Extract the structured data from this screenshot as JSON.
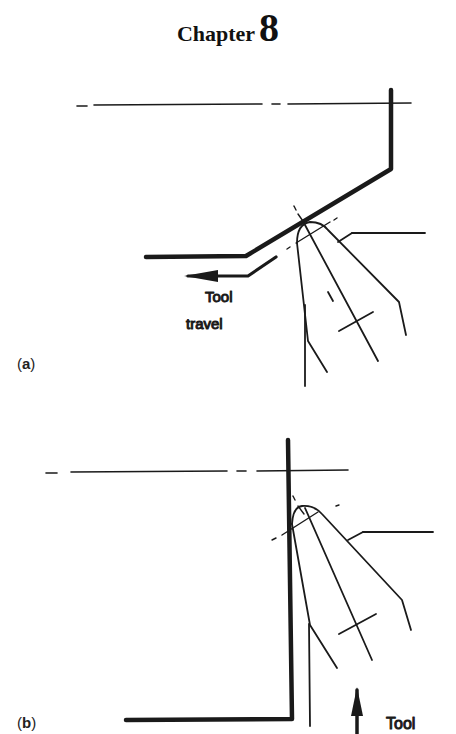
{
  "header": {
    "chapter_word": "Chapter",
    "chapter_number": "8"
  },
  "figure_a": {
    "panel_label_open": "(",
    "panel_label_letter": "a",
    "panel_label_close": ")",
    "annotation_line1": "Tool",
    "annotation_line2": "travel",
    "arrow_direction": "left"
  },
  "figure_b": {
    "panel_label_open": "(",
    "panel_label_letter": "b",
    "panel_label_close": ")",
    "annotation_line1": "Tool",
    "arrow_direction": "up"
  },
  "colors": {
    "ink": "#1a1a1a",
    "background": "#ffffff"
  }
}
